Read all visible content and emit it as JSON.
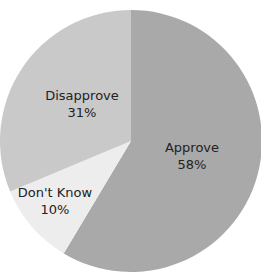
{
  "chart_data": {
    "type": "pie",
    "title": "",
    "slices": [
      {
        "label": "Approve",
        "value": 58,
        "display": "58%",
        "color": "#a9a9a9"
      },
      {
        "label": "Don't Know",
        "value": 10,
        "display": "10%",
        "color": "#ededed"
      },
      {
        "label": "Disapprove",
        "value": 31,
        "display": "31%",
        "color": "#c9c9c9"
      }
    ],
    "start_angle_deg": 0,
    "direction": "clockwise",
    "legend": "none (labels inside slices)"
  },
  "labels": {
    "approve": {
      "name": "Approve",
      "pct": "58%"
    },
    "dontknow": {
      "name": "Don't Know",
      "pct": "10%"
    },
    "disapprove": {
      "name": "Disapprove",
      "pct": "31%"
    }
  }
}
